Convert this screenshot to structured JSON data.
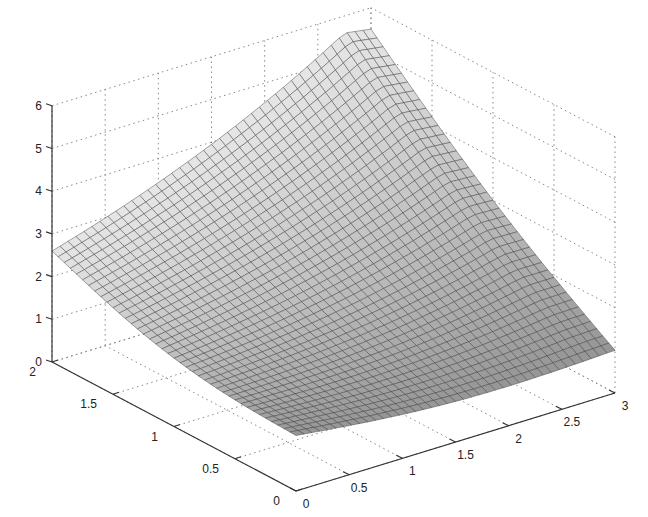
{
  "chart_data": {
    "type": "surface",
    "title": "",
    "xlabel": "",
    "ylabel": "",
    "zlabel": "",
    "xlim": [
      0,
      3
    ],
    "ylim": [
      0,
      2
    ],
    "zlim": [
      0,
      6
    ],
    "grid": true,
    "x_ticks": [
      "0",
      "0.5",
      "1",
      "1.5",
      "2",
      "2.5",
      "3"
    ],
    "y_ticks": [
      "0",
      "0.5",
      "1",
      "1.5",
      "2"
    ],
    "z_ticks": [
      "0",
      "1",
      "2",
      "3",
      "4",
      "5",
      "6"
    ],
    "mesh": {
      "nx": 40,
      "ny": 40
    },
    "corner_values": {
      "x0_y0": 1.3,
      "x3_y0": 1.0,
      "x0_y2": 2.6,
      "x3_y2": 5.5
    },
    "surface_color": "#8a8a8a",
    "edge_color": "#3a3a3a"
  }
}
